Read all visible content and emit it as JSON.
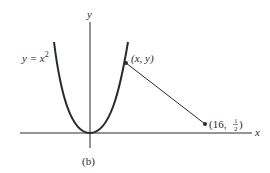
{
  "figure": {
    "caption": "(b)",
    "axes": {
      "x_label": "x",
      "y_label": "y"
    },
    "curve": {
      "equation": "y = x^2",
      "label_lhs": "y = x",
      "label_exp": "2"
    },
    "points": [
      {
        "id": "moving-point",
        "label": "(x, y)"
      },
      {
        "id": "fixed-point",
        "label_prefix": "(16, ",
        "label_num": "1",
        "label_den": "2",
        "label_suffix": ")",
        "x": 16,
        "y": 0.5
      }
    ],
    "colors": {
      "ink": "#2a2a2a",
      "background": "#ffffff"
    }
  }
}
